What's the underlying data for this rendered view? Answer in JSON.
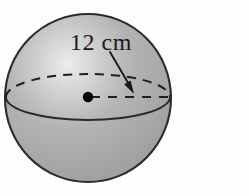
{
  "figure": {
    "type": "geometric-diagram",
    "shape_name": "sphere",
    "background_color": "#fefefe",
    "labels": {
      "dimension": "12 cm"
    },
    "annotations": {
      "dimension_value": "12",
      "dimension_unit": "cm",
      "measured_quantity": "radius",
      "arrow_points_to": "radius line from center to edge"
    },
    "geometry": {
      "center_x": 88,
      "center_y": 98,
      "radius_x": 83,
      "radius_y": 84,
      "equator_center_y": 97,
      "equator_radius_x": 82,
      "equator_radius_y": 23,
      "center_dot_radius": 5.2,
      "radius_line_start_x": 90,
      "radius_line_end_x": 170,
      "radius_line_y": 97,
      "arrow_start_x": 110,
      "arrow_start_y": 52,
      "arrow_tip_x": 134,
      "arrow_tip_y": 93,
      "label_x": 70,
      "label_y": 50
    },
    "colors": {
      "sphere_fill": "#a9a9a9",
      "sphere_highlight": "#e8e8e8",
      "sphere_shadow": "#9a9a9a",
      "outline": "#2b2b2b",
      "dashed_line": "#1f1f1f",
      "center_dot": "#000000",
      "label_text": "#1a1a1a",
      "arrow": "#1a1a1a"
    },
    "strokes": {
      "outline_width": 2.1,
      "equator_front_width": 1.9,
      "dash_pattern": "9 7",
      "dash_width": 2.0,
      "radius_dash_pattern": "9 8",
      "arrow_width": 1.9
    }
  }
}
